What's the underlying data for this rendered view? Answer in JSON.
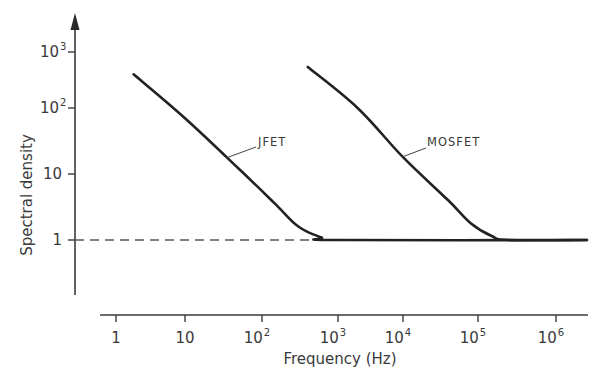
{
  "chart_data": {
    "type": "line",
    "title": "",
    "xlabel": "Frequency (Hz)",
    "ylabel": "Spectral density",
    "xscale": "log",
    "yscale": "log",
    "xlim": [
      1,
      2500000
    ],
    "ylim": [
      0.1,
      3000
    ],
    "grid": false,
    "legend": "none (inline labels)",
    "x_ticks": [
      {
        "value": 1,
        "base": "1",
        "exp": ""
      },
      {
        "value": 10,
        "base": "10",
        "exp": ""
      },
      {
        "value": 100,
        "base": "10",
        "exp": "2"
      },
      {
        "value": 1000,
        "base": "10",
        "exp": "3"
      },
      {
        "value": 10000,
        "base": "10",
        "exp": "4"
      },
      {
        "value": 100000,
        "base": "10",
        "exp": "5"
      },
      {
        "value": 1000000,
        "base": "10",
        "exp": "6"
      }
    ],
    "y_ticks": [
      {
        "value": 1,
        "base": "1",
        "exp": ""
      },
      {
        "value": 10,
        "base": "10",
        "exp": ""
      },
      {
        "value": 100,
        "base": "10",
        "exp": "2"
      },
      {
        "value": 1000,
        "base": "10",
        "exp": "3"
      }
    ],
    "series": [
      {
        "name": "JFET",
        "label": "JFET",
        "x": [
          1.8,
          10,
          50,
          150,
          300,
          600,
          1000,
          2500000
        ],
        "y": [
          400,
          70,
          12,
          3.5,
          1.6,
          1.1,
          1.0,
          1.0
        ]
      },
      {
        "name": "MOSFET",
        "label": "MOSFET",
        "x": [
          400,
          2000,
          10000,
          40000,
          80000,
          150000,
          250000,
          2500000
        ],
        "y": [
          540,
          100,
          18,
          4.0,
          1.8,
          1.15,
          1.0,
          1.0
        ]
      }
    ],
    "annotations": [
      {
        "type": "dashed-hline",
        "y": 1,
        "x_from": "axis",
        "x_to": 1000,
        "note": "white-noise reference level"
      }
    ]
  }
}
